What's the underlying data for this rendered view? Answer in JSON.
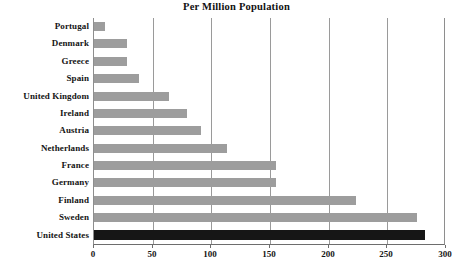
{
  "chart_data": {
    "type": "bar",
    "orientation": "horizontal",
    "title": "Per Million Population",
    "xlabel": "",
    "ylabel": "",
    "xlim": [
      0,
      300
    ],
    "xticks": [
      0,
      50,
      100,
      150,
      200,
      250,
      300
    ],
    "grid": "vertical",
    "legend": "none",
    "categories": [
      "Portugal",
      "Denmark",
      "Greece",
      "Spain",
      "United Kingdom",
      "Ireland",
      "Austria",
      "Netherlands",
      "France",
      "Germany",
      "Finland",
      "Sweden",
      "United States"
    ],
    "values": [
      9,
      28,
      28,
      38,
      64,
      79,
      91,
      113,
      155,
      155,
      223,
      275,
      282
    ],
    "bar_colors": [
      "#9d9d9d",
      "#9d9d9d",
      "#9d9d9d",
      "#9d9d9d",
      "#9d9d9d",
      "#9d9d9d",
      "#9d9d9d",
      "#9d9d9d",
      "#9d9d9d",
      "#9d9d9d",
      "#9d9d9d",
      "#9d9d9d",
      "#161616"
    ],
    "highlight_category": "United States",
    "colors": {
      "bar": "#9d9d9d",
      "bar_highlight": "#161616",
      "gridline": "#9a9a9a",
      "axis": "#6d6d6d",
      "text": "#141414",
      "background": "#ffffff"
    }
  }
}
